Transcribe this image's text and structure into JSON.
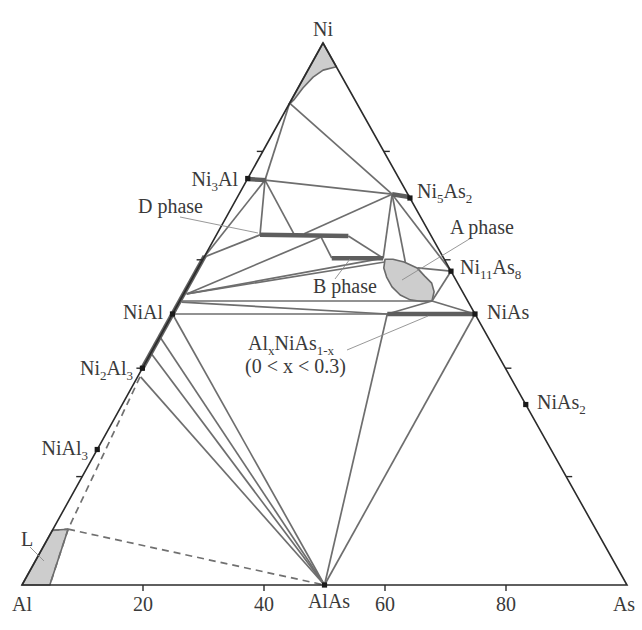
{
  "chart_data": {
    "type": "scatter",
    "coordinate_system": "ternary",
    "title": "",
    "vertices": {
      "top": "Ni",
      "left": "Al",
      "right": "As"
    },
    "axis": {
      "bottom_ticks": [
        20,
        40,
        60,
        80
      ],
      "edge_ticks_ni": [
        20,
        40,
        60,
        80
      ],
      "grid": false
    },
    "frame": {
      "Al": [
        22,
        585
      ],
      "As": [
        627,
        585
      ],
      "Ni": [
        323,
        43
      ]
    },
    "point_format": "[Ni %, As %] (Al = 100 - Ni - As)",
    "colors": {
      "frame": "#2b2b2b",
      "tie_line": "#6e6e6e",
      "phase_bar": "#5e5e5e",
      "region_fill": "#cdcdcd",
      "region_stroke": "#6a6a6a",
      "dashed": "#707070",
      "leader": "#8c8c8c",
      "marker": "#1a1a1a",
      "text": "#3a3a3a"
    },
    "compounds": [
      {
        "name": "Ni3Al",
        "point": [
          75,
          0
        ]
      },
      {
        "name": "NiAl",
        "point": [
          50,
          0
        ]
      },
      {
        "name": "Ni2Al3",
        "point": [
          40,
          0
        ]
      },
      {
        "name": "NiAl3",
        "point": [
          25,
          0
        ]
      },
      {
        "name": "Ni5As2",
        "point": [
          71.4,
          28.6
        ]
      },
      {
        "name": "Ni11As8",
        "point": [
          57.9,
          42.1
        ]
      },
      {
        "name": "NiAs",
        "point": [
          50,
          50
        ]
      },
      {
        "name": "NiAs2",
        "point": [
          33.3,
          66.7
        ]
      },
      {
        "name": "AlAs",
        "point": [
          0,
          50
        ]
      }
    ],
    "regions": [
      {
        "name": "Ni corner region",
        "points": [
          [
            100,
            0
          ],
          [
            95.6,
            4.4
          ],
          [
            95.0,
            2.5
          ],
          [
            93.7,
            1.5
          ],
          [
            91.7,
            0.8
          ],
          [
            89.5,
            0.4
          ],
          [
            88.6,
            0
          ]
        ]
      },
      {
        "name": "A phase",
        "points": [
          [
            60.1,
            30.1
          ],
          [
            58.5,
            30.7
          ],
          [
            56.8,
            32.0
          ],
          [
            55.0,
            33.8
          ],
          [
            53.5,
            35.9
          ],
          [
            52.6,
            38.0
          ],
          [
            52.3,
            40.1
          ],
          [
            52.4,
            41.7
          ],
          [
            54.1,
            41.2
          ],
          [
            55.7,
            40.0
          ],
          [
            57.0,
            38.2
          ],
          [
            58.5,
            36.2
          ],
          [
            59.6,
            33.5
          ],
          [
            60.1,
            31.4
          ]
        ]
      },
      {
        "name": "L",
        "points": [
          [
            0,
            0
          ],
          [
            10.1,
            0
          ],
          [
            10.3,
            2.5
          ],
          [
            0,
            4.6
          ]
        ]
      }
    ],
    "phase_bars": [
      {
        "name": "Ni3Al range",
        "from": [
          74.9,
          0
        ],
        "to": [
          74.7,
          3.2
        ]
      },
      {
        "name": "Ni5As2 range",
        "from": [
          72.1,
          25.3
        ],
        "to": [
          71.6,
          28.4
        ]
      },
      {
        "name": "D phase",
        "from": [
          64.6,
          7.2
        ],
        "to": [
          64.4,
          21.9
        ]
      },
      {
        "name": "B phase",
        "from": [
          60.3,
          21.2
        ],
        "to": [
          60.3,
          29.7
        ]
      },
      {
        "name": "AlxNiAs1-x (0 < x < 0.3)",
        "from": [
          50,
          35.5
        ],
        "to": [
          50,
          50
        ]
      },
      {
        "name": "NiAl range",
        "from": [
          39.7,
          0
        ],
        "to": [
          60.7,
          0
        ]
      }
    ],
    "tie_lines": [
      [
        [
          88.9,
          0
        ],
        [
          74.7,
          3.0
        ]
      ],
      [
        [
          88.9,
          0
        ],
        [
          72.1,
          25.3
        ]
      ],
      [
        [
          74.7,
          3.0
        ],
        [
          72.1,
          25.3
        ]
      ],
      [
        [
          74.7,
          3.0
        ],
        [
          64.6,
          7.2
        ]
      ],
      [
        [
          74.7,
          3.0
        ],
        [
          64.8,
          12.7
        ]
      ],
      [
        [
          74.7,
          3.0
        ],
        [
          60.5,
          0
        ]
      ],
      [
        [
          64.6,
          7.2
        ],
        [
          60.5,
          0
        ]
      ],
      [
        [
          64.8,
          14.4
        ],
        [
          72.1,
          25.3
        ]
      ],
      [
        [
          64.2,
          17.5
        ],
        [
          60.3,
          21.2
        ]
      ],
      [
        [
          64.4,
          21.9
        ],
        [
          60.3,
          29.7
        ]
      ],
      [
        [
          64.2,
          17.5
        ],
        [
          53.7,
          0.5
        ]
      ],
      [
        [
          60.3,
          29.7
        ],
        [
          53.7,
          0.5
        ]
      ],
      [
        [
          59.6,
          30.3
        ],
        [
          53.7,
          0.5
        ]
      ],
      [
        [
          72.1,
          25.3
        ],
        [
          60.3,
          29.7
        ]
      ],
      [
        [
          72.1,
          25.3
        ],
        [
          59.6,
          33.7
        ]
      ],
      [
        [
          72.1,
          25.3
        ],
        [
          57.9,
          42.1
        ]
      ],
      [
        [
          58.5,
          36.3
        ],
        [
          57.9,
          42.1
        ]
      ],
      [
        [
          52.4,
          41.7
        ],
        [
          57.9,
          42.1
        ]
      ],
      [
        [
          52.4,
          41.7
        ],
        [
          50,
          50
        ]
      ],
      [
        [
          52.4,
          41.7
        ],
        [
          50,
          35.5
        ]
      ],
      [
        [
          52.4,
          0.4
        ],
        [
          52.4,
          41.7
        ]
      ],
      [
        [
          52.2,
          0.4
        ],
        [
          50,
          35.5
        ]
      ],
      [
        [
          50,
          0
        ],
        [
          50,
          50
        ]
      ],
      [
        [
          50,
          35.5
        ],
        [
          0,
          50
        ]
      ],
      [
        [
          50,
          50
        ],
        [
          0,
          50
        ]
      ],
      [
        [
          50,
          0
        ],
        [
          0,
          50
        ]
      ],
      [
        [
          45.8,
          0
        ],
        [
          0,
          50
        ]
      ],
      [
        [
          42.8,
          0
        ],
        [
          0,
          50
        ]
      ],
      [
        [
          38.4,
          0.5
        ],
        [
          0,
          50
        ]
      ]
    ],
    "dashed_lines": [
      [
        [
          38.4,
          0.4
        ],
        [
          10.3,
          2.5
        ],
        [
          0,
          4.6
        ]
      ],
      [
        [
          10.1,
          0
        ],
        [
          10.3,
          2.5
        ]
      ],
      [
        [
          10.3,
          2.5
        ],
        [
          0,
          50
        ]
      ]
    ],
    "annotations": [
      {
        "label": "D phase",
        "leader_px": [
          [
            180,
            217
          ],
          [
            258,
            233
          ]
        ]
      },
      {
        "label": "B phase",
        "leader_px": [
          [
            335,
            279
          ],
          [
            350,
            259
          ]
        ]
      },
      {
        "label": "A phase",
        "leader_px": [
          [
            471,
            238
          ],
          [
            402,
            280
          ]
        ]
      },
      {
        "label": "AlxNiAs1-x (0 < x < 0.3)",
        "leader_px": [
          [
            347,
            350
          ],
          [
            428,
            316
          ]
        ]
      },
      {
        "label": "L",
        "leader_px": [
          [
            30,
            547
          ],
          [
            44,
            561
          ]
        ]
      }
    ],
    "labels": {
      "ni": "Ni",
      "ni3al": [
        "Ni",
        "3",
        "Al"
      ],
      "ni5as2": [
        "Ni",
        "5",
        "As",
        "2"
      ],
      "d_phase": "D phase",
      "a_phase": "A phase",
      "ni11as8": [
        "Ni",
        "11",
        "As",
        "8"
      ],
      "b_phase": "B phase",
      "nial": "NiAl",
      "nias": "NiAs",
      "alxnias": [
        "Al",
        "x",
        "NiAs",
        "1-x"
      ],
      "alxnias_range": "(0 < x < 0.3)",
      "ni2al3": [
        "Ni",
        "2",
        "Al",
        "3"
      ],
      "nias2": [
        "NiAs",
        "2"
      ],
      "nial3": [
        "NiAl",
        "3"
      ],
      "l": "L",
      "bottom": {
        "al": "Al",
        "t20": "20",
        "t40": "40",
        "alas": "AlAs",
        "t60": "60",
        "t80": "80",
        "as": "As"
      }
    }
  }
}
